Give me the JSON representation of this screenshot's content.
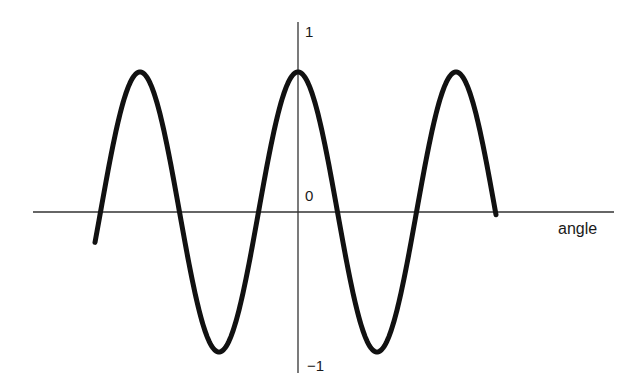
{
  "chart_data": {
    "type": "line",
    "title": "",
    "xlabel": "angle",
    "ylabel": "",
    "y_tick_labels": [
      "1",
      "0",
      "−1"
    ],
    "y_ticks": [
      1,
      0,
      -1
    ],
    "ylim": [
      -1,
      1
    ],
    "grid": false,
    "legend": null,
    "series": [
      {
        "name": "cosine wave",
        "function": "cos(angle)",
        "amplitude": 1,
        "periods_shown": 2.55,
        "x": [
          -2.6,
          -2.5,
          -2,
          -1.5,
          -1,
          -0.5,
          0,
          0.5,
          1,
          1.5,
          2,
          2.5
        ],
        "x_unit": "fraction of period (peak at 0)",
        "values_note": "x in multiples of one period; y = cos(2πx)",
        "y": [
          -0.81,
          -1.0,
          1.0,
          -1.0,
          1.0,
          -1.0,
          1.0,
          -1.0,
          1.0,
          -1.0,
          1.0,
          0.0
        ]
      }
    ],
    "features": {
      "peaks_at_period_multiples": [
        -1,
        0,
        1
      ],
      "troughs_at_period_multiples": [
        -0.5,
        0.5
      ],
      "zero_crossings_at_period_multiples": [
        -1.25,
        -0.75,
        -0.25,
        0.25,
        0.75,
        1.25
      ]
    }
  },
  "axes": {
    "x_label": "angle",
    "y_top_label": "1",
    "origin_label": "0",
    "y_bottom_label": "−1"
  },
  "colors": {
    "curve": "#111111",
    "axis": "#333333",
    "text": "#1a1a1a",
    "background": "#ffffff"
  }
}
